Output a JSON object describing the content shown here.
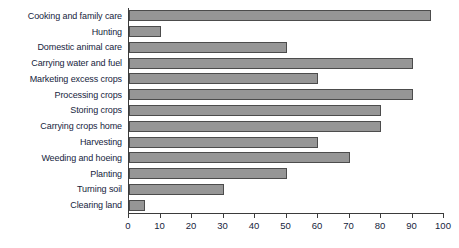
{
  "chart_data": {
    "type": "bar",
    "orientation": "horizontal",
    "title": "",
    "subtitle": "",
    "xlabel": "",
    "ylabel": "",
    "xlim": [
      0,
      100
    ],
    "grid": false,
    "legend": null,
    "legend_position": "none",
    "bar_color": "#969696",
    "bar_border_color": "#4c4c4c",
    "axis_color": "#3b3b3b",
    "text_color": "#16243d",
    "categories": [
      "Cooking and family care",
      "Hunting",
      "Domestic animal care",
      "Carrying water and fuel",
      "Marketing excess crops",
      "Processing crops",
      "Storing crops",
      "Carrying crops home",
      "Harvesting",
      "Weeding and hoeing",
      "Planting",
      "Turning soil",
      "Clearing land"
    ],
    "values": [
      96,
      10,
      50,
      90,
      60,
      90,
      80,
      80,
      60,
      70,
      50,
      30,
      5
    ],
    "xticks": [
      0,
      10,
      20,
      30,
      40,
      50,
      60,
      70,
      80,
      90,
      100
    ],
    "xticklabels": [
      "0",
      "10",
      "20",
      "30",
      "40",
      "50",
      "60",
      "70",
      "80",
      "90",
      "100"
    ]
  }
}
